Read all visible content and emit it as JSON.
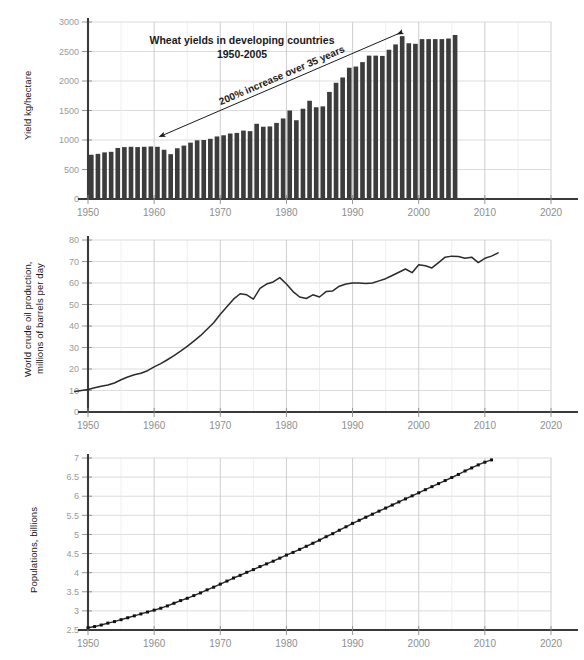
{
  "figure": {
    "background": "#ffffff",
    "grid_color": "#d8d8d8",
    "axis_color": "#3a3a3a",
    "bar_color": "#3c3c3c",
    "line_color": "#2b2b2b",
    "tick_label_color": "#9a9a9a"
  },
  "charts": [
    {
      "id": "wheat-yields",
      "chart_data": {
        "type": "bar",
        "title": "Wheat yields in developing countries",
        "subtitle": "1950-2005",
        "xlabel": "",
        "ylabel": "Yield kg/hectare",
        "xlim": [
          1948,
          2022
        ],
        "ylim": [
          0,
          3000
        ],
        "grid": true,
        "legend": "none",
        "yticks": [
          0,
          500,
          1000,
          1500,
          2000,
          2500,
          3000
        ],
        "ytick_labels": [
          "0",
          "500",
          "1000",
          "1500",
          "2000",
          "2500",
          "3000"
        ],
        "xticks": [
          1950,
          1960,
          1970,
          1980,
          1990,
          2000,
          2010,
          2020
        ],
        "xtick_labels": [
          "1950",
          "1960",
          "1970",
          "1980",
          "1990",
          "2000",
          "2010",
          "2020"
        ],
        "annotations": [
          {
            "text": "200% increase over 35 years",
            "type": "double-headed-arrow",
            "from_year": 1961,
            "from_value": 1090,
            "to_year": 1997,
            "to_value": 2830
          }
        ],
        "categories": [
          1950,
          1951,
          1952,
          1953,
          1954,
          1955,
          1956,
          1957,
          1958,
          1959,
          1960,
          1961,
          1962,
          1963,
          1964,
          1965,
          1966,
          1967,
          1968,
          1969,
          1970,
          1971,
          1972,
          1973,
          1974,
          1975,
          1976,
          1977,
          1978,
          1979,
          1980,
          1981,
          1982,
          1983,
          1984,
          1985,
          1986,
          1987,
          1988,
          1989,
          1990,
          1991,
          1992,
          1993,
          1994,
          1995,
          1996,
          1997,
          1998,
          1999,
          2000,
          2001,
          2002,
          2003,
          2004,
          2005
        ],
        "values": [
          750,
          765,
          790,
          800,
          865,
          880,
          885,
          880,
          885,
          890,
          885,
          835,
          760,
          860,
          905,
          955,
          995,
          1000,
          1020,
          1060,
          1080,
          1110,
          1120,
          1160,
          1150,
          1275,
          1225,
          1230,
          1290,
          1365,
          1500,
          1335,
          1530,
          1665,
          1555,
          1570,
          1815,
          1970,
          2060,
          2225,
          2245,
          2320,
          2430,
          2430,
          2425,
          2530,
          2620,
          2760,
          2640,
          2630,
          2710,
          2710,
          2710,
          2710,
          2720,
          2780
        ]
      }
    },
    {
      "id": "world-crude-oil-production",
      "chart_data": {
        "type": "line",
        "title": "",
        "xlabel": "",
        "ylabel": "World crude oil production,\nmillions of barrels per day",
        "xlim": [
          1948,
          2022
        ],
        "ylim": [
          0,
          80
        ],
        "grid": true,
        "legend": "none",
        "yticks": [
          0,
          10,
          20,
          30,
          40,
          50,
          60,
          70,
          80
        ],
        "ytick_labels": [
          "0",
          "10",
          "20",
          "30",
          "40",
          "50",
          "60",
          "70",
          "80"
        ],
        "xticks": [
          1950,
          1960,
          1970,
          1980,
          1990,
          2000,
          2010,
          2020
        ],
        "xtick_labels": [
          "1950",
          "1960",
          "1970",
          "1980",
          "1990",
          "2000",
          "2010",
          "2020"
        ],
        "x": [
          1948,
          1949,
          1950,
          1951,
          1952,
          1953,
          1954,
          1955,
          1956,
          1957,
          1958,
          1959,
          1960,
          1961,
          1962,
          1963,
          1964,
          1965,
          1966,
          1967,
          1968,
          1969,
          1970,
          1971,
          1972,
          1973,
          1974,
          1975,
          1976,
          1977,
          1978,
          1979,
          1980,
          1981,
          1982,
          1983,
          1984,
          1985,
          1986,
          1987,
          1988,
          1989,
          1990,
          1991,
          1992,
          1993,
          1994,
          1995,
          1996,
          1997,
          1998,
          1999,
          2000,
          2001,
          2002,
          2003,
          2004,
          2005,
          2006,
          2007,
          2008,
          2009,
          2010,
          2011,
          2012
        ],
        "values": [
          9.5,
          10.0,
          10.5,
          11.3,
          12.0,
          12.6,
          13.5,
          15.0,
          16.3,
          17.3,
          18.0,
          19.2,
          21.0,
          22.5,
          24.3,
          26.2,
          28.3,
          30.5,
          33.0,
          35.5,
          38.5,
          41.5,
          45.5,
          49.0,
          52.5,
          55.0,
          54.5,
          52.5,
          57.5,
          59.5,
          60.5,
          62.5,
          59.5,
          56.0,
          53.5,
          52.8,
          54.5,
          53.5,
          56.0,
          56.3,
          58.5,
          59.5,
          60.0,
          60.0,
          59.8,
          60.0,
          61.0,
          62.0,
          63.5,
          65.0,
          66.5,
          64.8,
          68.5,
          68.0,
          67.0,
          69.5,
          72.0,
          72.5,
          72.3,
          71.5,
          72.0,
          69.5,
          71.5,
          72.5,
          74.0
        ]
      }
    },
    {
      "id": "world-population",
      "chart_data": {
        "type": "line",
        "title": "",
        "xlabel": "",
        "ylabel": "Populations, billions",
        "xlim": [
          1948,
          2022
        ],
        "ylim": [
          2.5,
          7
        ],
        "grid": true,
        "legend": "none",
        "markers": "square",
        "yticks": [
          2.5,
          3,
          3.5,
          4,
          4.5,
          5,
          5.5,
          6,
          6.5,
          7
        ],
        "ytick_labels": [
          "2.5",
          "3",
          "3.5",
          "4",
          "4.5",
          "5",
          "5.5",
          "6",
          "6.5",
          "7"
        ],
        "xticks": [
          1950,
          1960,
          1970,
          1980,
          1990,
          2000,
          2010,
          2020
        ],
        "xtick_labels": [
          "1950",
          "1960",
          "1970",
          "1980",
          "1990",
          "2000",
          "2010",
          "2020"
        ],
        "x": [
          1950,
          1951,
          1952,
          1953,
          1954,
          1955,
          1956,
          1957,
          1958,
          1959,
          1960,
          1961,
          1962,
          1963,
          1964,
          1965,
          1966,
          1967,
          1968,
          1969,
          1970,
          1971,
          1972,
          1973,
          1974,
          1975,
          1976,
          1977,
          1978,
          1979,
          1980,
          1981,
          1982,
          1983,
          1984,
          1985,
          1986,
          1987,
          1988,
          1989,
          1990,
          1991,
          1992,
          1993,
          1994,
          1995,
          1996,
          1997,
          1998,
          1999,
          2000,
          2001,
          2002,
          2003,
          2004,
          2005,
          2006,
          2007,
          2008,
          2009,
          2010,
          2011
        ],
        "values": [
          2.56,
          2.59,
          2.63,
          2.68,
          2.72,
          2.77,
          2.82,
          2.87,
          2.92,
          2.97,
          3.02,
          3.07,
          3.13,
          3.2,
          3.27,
          3.33,
          3.4,
          3.47,
          3.55,
          3.62,
          3.7,
          3.78,
          3.86,
          3.93,
          4.01,
          4.08,
          4.16,
          4.23,
          4.3,
          4.38,
          4.46,
          4.53,
          4.61,
          4.69,
          4.77,
          4.85,
          4.94,
          5.02,
          5.11,
          5.2,
          5.29,
          5.37,
          5.45,
          5.53,
          5.61,
          5.69,
          5.77,
          5.85,
          5.93,
          6.01,
          6.09,
          6.17,
          6.25,
          6.33,
          6.41,
          6.49,
          6.57,
          6.66,
          6.74,
          6.82,
          6.89,
          6.95
        ]
      }
    }
  ]
}
